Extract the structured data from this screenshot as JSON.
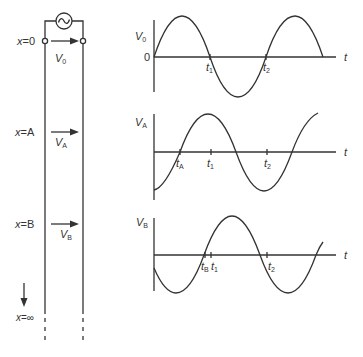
{
  "figure": {
    "stroke_color": "#333333",
    "background": "#ffffff"
  },
  "line": {
    "source_symbol": "~",
    "positions": [
      {
        "x_label": "x",
        "eq": "=",
        "pos": "0",
        "voltage_label": "V",
        "voltage_sub": "0"
      },
      {
        "x_label": "x",
        "eq": "=",
        "pos": "A",
        "voltage_label": "V",
        "voltage_sub": "A"
      },
      {
        "x_label": "x",
        "eq": "=",
        "pos": "B",
        "voltage_label": "V",
        "voltage_sub": "B"
      },
      {
        "x_label": "x",
        "eq": "=",
        "pos": "∞"
      }
    ]
  },
  "plots": [
    {
      "ylabel": "V",
      "ylabel_sub": "0",
      "origin_label": "0",
      "xlabel": "t",
      "ticks": [
        {
          "label": "t",
          "sub": "1"
        },
        {
          "label": "t",
          "sub": "2"
        }
      ]
    },
    {
      "ylabel": "V",
      "ylabel_sub": "A",
      "xlabel": "t",
      "ticks": [
        {
          "label": "t",
          "sub": "A"
        },
        {
          "label": "t",
          "sub": "1"
        },
        {
          "label": "t",
          "sub": "2"
        }
      ]
    },
    {
      "ylabel": "V",
      "ylabel_sub": "B",
      "xlabel": "t",
      "ticks": [
        {
          "label": "t",
          "sub": "B"
        },
        {
          "label": "t",
          "sub": "1"
        },
        {
          "label": "t",
          "sub": "2"
        }
      ]
    }
  ]
}
